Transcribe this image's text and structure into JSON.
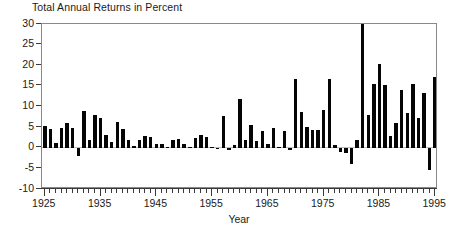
{
  "chart_data": {
    "type": "bar",
    "title": "Total Annual Returns in Percent",
    "subtitle": "",
    "xlabel": "Year",
    "ylabel": "",
    "xlim": [
      1924.5,
      1995.5
    ],
    "ylim": [
      -10,
      30
    ],
    "grid": false,
    "legend": null,
    "bar_color": "#050505",
    "axis_color": "#3a3a3a",
    "zero_line": 0,
    "y_ticks": [
      30,
      25,
      20,
      15,
      10,
      5,
      0,
      -5,
      -10
    ],
    "y_tick_labels": [
      "30",
      "25",
      "20",
      "15",
      "10",
      "5",
      "0",
      "-5",
      "-10"
    ],
    "x_ticks_major": [
      1925,
      1935,
      1945,
      1955,
      1965,
      1975,
      1985,
      1995
    ],
    "x_tick_labels": [
      "1925",
      "1935",
      "1945",
      "1955",
      "1965",
      "1975",
      "1985",
      "1995"
    ],
    "x_tick_minor_step": 1,
    "categories": [
      1925,
      1926,
      1927,
      1928,
      1929,
      1930,
      1931,
      1932,
      1933,
      1934,
      1935,
      1936,
      1937,
      1938,
      1939,
      1940,
      1941,
      1942,
      1943,
      1944,
      1945,
      1946,
      1947,
      1948,
      1949,
      1950,
      1951,
      1952,
      1953,
      1954,
      1955,
      1956,
      1957,
      1958,
      1959,
      1960,
      1961,
      1962,
      1963,
      1964,
      1965,
      1966,
      1967,
      1968,
      1969,
      1970,
      1971,
      1972,
      1973,
      1974,
      1975,
      1976,
      1977,
      1978,
      1979,
      1980,
      1981,
      1982,
      1983,
      1984,
      1985,
      1986,
      1987,
      1988,
      1989,
      1990,
      1991,
      1992,
      1993,
      1994,
      1995
    ],
    "values": [
      5.3,
      4.6,
      1.2,
      4.8,
      6.0,
      4.7,
      -1.9,
      8.8,
      1.8,
      8.0,
      7.2,
      3.1,
      1.5,
      6.3,
      4.6,
      2.0,
      0.5,
      1.9,
      2.8,
      2.5,
      1.0,
      0.9,
      0.3,
      2.0,
      2.2,
      0.8,
      0.2,
      2.3,
      3.2,
      2.5,
      0.2,
      -0.2,
      7.8,
      -0.5,
      0.6,
      11.8,
      2.0,
      5.6,
      1.6,
      4.0,
      1.0,
      4.7,
      0.2,
      4.0,
      -0.5,
      16.7,
      8.7,
      5.1,
      4.3,
      4.4,
      9.2,
      16.7,
      0.6,
      -1.1,
      -1.2,
      -4.0,
      1.8,
      29.9,
      8.0,
      15.5,
      20.4,
      15.1,
      2.9,
      6.1,
      14.0,
      8.5,
      15.5,
      7.2,
      13.2,
      -5.3,
      17.2
    ],
    "units": "percent",
    "note": "One bar per year from 1925 to 1995; bars rise from the zero baseline, negative years drawn below it."
  },
  "axis": {
    "x_title": "Year"
  }
}
